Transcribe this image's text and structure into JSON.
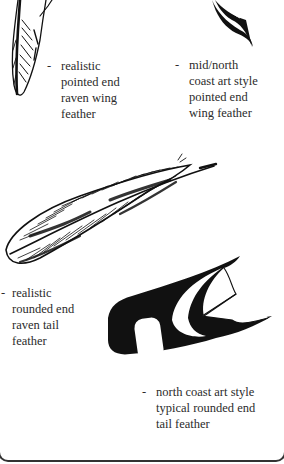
{
  "figure": {
    "panels": [
      {
        "id": "realistic-pointed-wing",
        "dash": "-",
        "lines": [
          "realistic",
          "pointed end",
          "raven wing",
          "feather"
        ]
      },
      {
        "id": "mid-north-coast-pointed-wing",
        "dash": "-",
        "lines": [
          "mid/north",
          "coast art style",
          "pointed end",
          "wing feather"
        ]
      },
      {
        "id": "realistic-rounded-tail",
        "dash": "-",
        "lines": [
          "realistic",
          "rounded end",
          "raven tail",
          "feather"
        ]
      },
      {
        "id": "north-coast-rounded-tail",
        "dash": "-",
        "lines": [
          "north coast art style",
          "typical rounded end",
          "tail feather"
        ]
      }
    ],
    "colors": {
      "ink": "#111111",
      "text": "#2b2b2b",
      "background": "#ffffff"
    }
  }
}
